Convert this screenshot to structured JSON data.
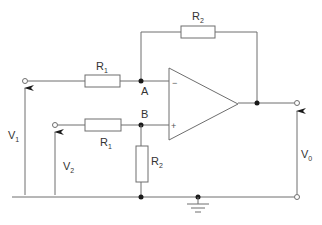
{
  "diagram": {
    "type": "circuit-schematic",
    "components": {
      "r1_top": {
        "label": "R",
        "sub": "1"
      },
      "r2_feedback": {
        "label": "R",
        "sub": "2"
      },
      "r1_bottom": {
        "label": "R",
        "sub": "1"
      },
      "r2_ground": {
        "label": "R",
        "sub": "2"
      },
      "opamp": {
        "minus": "−",
        "plus": "+"
      }
    },
    "nodes": {
      "a": "A",
      "b": "B"
    },
    "voltages": {
      "v1": {
        "label": "V",
        "sub": "1"
      },
      "v2": {
        "label": "V",
        "sub": "2"
      },
      "vo": {
        "label": "V",
        "sub": "0"
      }
    },
    "colors": {
      "wire": "#6e6e6e",
      "node": "#1a1a1a",
      "text": "#333333"
    }
  }
}
